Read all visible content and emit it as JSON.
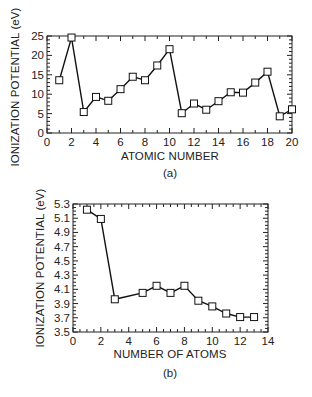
{
  "chart_data": [
    {
      "type": "line",
      "panel": "(a)",
      "xlabel": "ATOMIC NUMBER",
      "ylabel": "IONIZATION POTENTIAL (eV)",
      "xlim": [
        0,
        20
      ],
      "ylim": [
        0,
        25
      ],
      "xticks": [
        0,
        2,
        4,
        6,
        8,
        10,
        12,
        14,
        16,
        18,
        20
      ],
      "yticks": [
        0,
        5,
        10,
        15,
        20,
        25
      ],
      "marker": "open-square",
      "grid": false,
      "x": [
        1,
        2,
        3,
        4,
        5,
        6,
        7,
        8,
        9,
        10,
        11,
        12,
        13,
        14,
        15,
        16,
        17,
        18,
        19,
        20
      ],
      "values": [
        13.6,
        24.6,
        5.4,
        9.3,
        8.3,
        11.3,
        14.5,
        13.6,
        17.4,
        21.6,
        5.1,
        7.6,
        6.0,
        8.2,
        10.5,
        10.4,
        13.0,
        15.8,
        4.3,
        6.1
      ]
    },
    {
      "type": "line",
      "panel": "(b)",
      "xlabel": "NUMBER OF ATOMS",
      "ylabel": "IONIZATION POTENTIAL (eV)",
      "xlim": [
        0,
        14
      ],
      "ylim": [
        3.5,
        5.3
      ],
      "xticks": [
        0,
        2,
        4,
        6,
        8,
        10,
        12,
        14
      ],
      "yticks": [
        3.5,
        3.7,
        3.9,
        4.1,
        4.3,
        4.5,
        4.7,
        4.9,
        5.1,
        5.3
      ],
      "marker": "open-square",
      "grid": false,
      "x": [
        1,
        2,
        3,
        5,
        6,
        7,
        8,
        9,
        10,
        11,
        12,
        13
      ],
      "values": [
        5.22,
        5.09,
        3.96,
        4.05,
        4.15,
        4.05,
        4.15,
        3.94,
        3.86,
        3.76,
        3.71,
        3.71
      ]
    }
  ],
  "labels": {
    "top_ylabel": "IONIZATION POTENTIAL (eV)",
    "top_xlabel": "ATOMIC NUMBER",
    "top_caption": "(a)",
    "bottom_ylabel": "IONIZATION POTENTIAL (eV)",
    "bottom_xlabel": "NUMBER OF ATOMS",
    "bottom_caption": "(b)"
  }
}
